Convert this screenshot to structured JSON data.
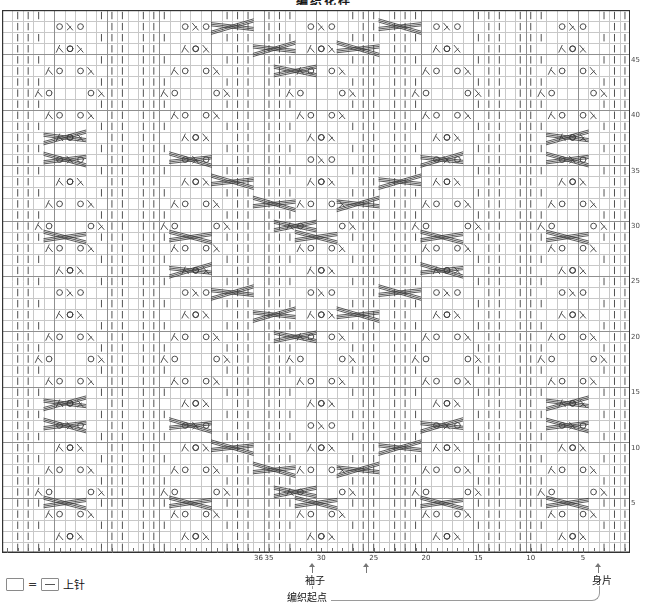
{
  "title": "编织花样",
  "chart": {
    "columns": 60,
    "rows": 49,
    "cell_width": 10.47,
    "cell_height": 11.08,
    "grid_color": "#c8c8c8",
    "bold_grid_color": "#8f8f8f",
    "border_color": "#333333",
    "symbol_color": "#3d3d3d",
    "bold_every_cols": 5,
    "bold_every_rows": 5
  },
  "legend": {
    "empty_label": "",
    "equals": "=",
    "purl_label": "上针"
  },
  "axes": {
    "column_ticks": [
      {
        "col": 36,
        "label": "36"
      },
      {
        "col": 35,
        "label": "35"
      },
      {
        "col": 30,
        "label": "30"
      },
      {
        "col": 25,
        "label": "25"
      },
      {
        "col": 20,
        "label": "20"
      },
      {
        "col": 15,
        "label": "15"
      },
      {
        "col": 10,
        "label": "10"
      },
      {
        "col": 5,
        "label": "5"
      }
    ],
    "row_ticks": [
      {
        "row": 45,
        "label": "45"
      },
      {
        "row": 40,
        "label": "40"
      },
      {
        "row": 35,
        "label": "35"
      },
      {
        "row": 30,
        "label": "30"
      },
      {
        "row": 25,
        "label": "25"
      },
      {
        "row": 20,
        "label": "20"
      },
      {
        "row": 15,
        "label": "15"
      },
      {
        "row": 10,
        "label": "10"
      },
      {
        "row": 5,
        "label": "5"
      }
    ]
  },
  "annotations": {
    "sleeve": "袖子",
    "body": "身片",
    "start": "编织起点"
  },
  "chart_data": {
    "type": "table",
    "title": "编织花样",
    "symbols": {
      "purl": "|",
      "yarn_over": "O",
      "decrease_left": "λ",
      "decrease_right": "人",
      "cable": "cross"
    },
    "motif_columns": [
      12,
      24,
      36,
      48
    ],
    "motif_row_period": 24,
    "chevron_row_anchors": [
      8,
      18,
      32,
      44
    ]
  }
}
